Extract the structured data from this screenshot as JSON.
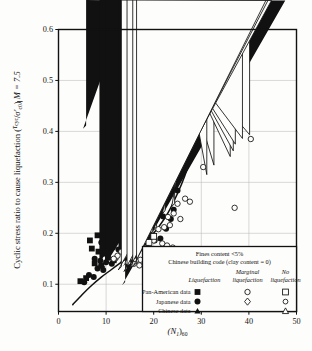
{
  "figure": {
    "background": "#fdfdfb",
    "frame_color": "#111111",
    "grid_color": "#b9b9b9",
    "curve_color": "#111111"
  },
  "axes": {
    "x_title_main": "(N",
    "x_title_sub1": "1",
    "x_title_mid": ")",
    "x_title_sub2": "60",
    "x_ticks": [
      "0",
      "10",
      "20",
      "30",
      "40",
      "50"
    ],
    "x_values": [
      0,
      10,
      20,
      30,
      40,
      50
    ],
    "y_ticks": [
      "0.1",
      "0.2",
      "0.3",
      "0.4",
      "0.5",
      "0.6"
    ],
    "y_values": [
      0.1,
      0.2,
      0.3,
      0.4,
      0.5,
      0.6
    ],
    "y_title_part1": "Cyclic stress ratio to cause liquefaction",
    "y_title_num": "τ",
    "y_title_num_sub": "cyc",
    "y_title_den": "σ'",
    "y_title_den_sub": "c0",
    "y_title_magnitude": "M = 7.5",
    "xlim": [
      0,
      50
    ],
    "ylim": [
      0.05,
      0.6
    ]
  },
  "legend": {
    "note_line1": "Fines content <5%",
    "note_line2": "Chinese building code (clay content = 0)",
    "col_header_2_line1": "Marginal",
    "col_header_3_line1": "No",
    "col_header_1": "Liquefaction",
    "col_header_2": "liquefaction",
    "col_header_3": "liquefaction",
    "rows": [
      {
        "label": "Pan-American data",
        "liq": "filled-square",
        "marginal": "open-circle",
        "no": "open-square"
      },
      {
        "label": "Japanese data",
        "liq": "filled-circle",
        "marginal": "open-diamond",
        "no": "open-circle-small"
      },
      {
        "label": "Chinese data",
        "liq": "filled-triangle",
        "marginal": "",
        "no": "open-triangle"
      }
    ]
  },
  "chart_data": {
    "type": "scatter",
    "title": "",
    "xlabel": "(N1)60",
    "ylabel": "Cyclic stress ratio to cause liquefaction (τcyc/σ'c0) M = 7.5",
    "xlim": [
      0,
      50
    ],
    "ylim": [
      0.05,
      0.6
    ],
    "grid": true,
    "series": [
      {
        "name": "Japanese data - Liquefaction",
        "marker": "filled-circle",
        "points": [
          [
            11.0,
            0.345
          ],
          [
            14.6,
            0.377
          ],
          [
            14.5,
            0.325
          ],
          [
            12.6,
            0.295
          ],
          [
            12.2,
            0.268
          ],
          [
            17.6,
            0.268
          ],
          [
            20.6,
            0.262
          ],
          [
            22.0,
            0.233
          ],
          [
            9.4,
            0.232
          ],
          [
            11.0,
            0.225
          ],
          [
            13.0,
            0.228
          ],
          [
            14.2,
            0.222
          ],
          [
            15.6,
            0.252
          ],
          [
            12.4,
            0.206
          ],
          [
            13.1,
            0.203
          ],
          [
            13.8,
            0.2
          ],
          [
            14.6,
            0.199
          ],
          [
            15.6,
            0.198
          ],
          [
            16.6,
            0.196
          ],
          [
            17.6,
            0.206
          ],
          [
            18.4,
            0.196
          ],
          [
            19.6,
            0.193
          ],
          [
            10.6,
            0.198
          ],
          [
            11.6,
            0.194
          ],
          [
            9.0,
            0.182
          ],
          [
            10.0,
            0.178
          ],
          [
            11.4,
            0.172
          ],
          [
            12.6,
            0.168
          ],
          [
            7.6,
            0.15
          ],
          [
            8.8,
            0.146
          ],
          [
            10.0,
            0.143
          ],
          [
            11.2,
            0.14
          ],
          [
            8.2,
            0.131
          ],
          [
            9.4,
            0.128
          ],
          [
            6.4,
            0.118
          ],
          [
            7.4,
            0.114
          ],
          [
            5.4,
            0.104
          ],
          [
            18.6,
            0.181
          ],
          [
            20.2,
            0.186
          ],
          [
            21.4,
            0.19
          ],
          [
            22.6,
            0.209
          ],
          [
            23.6,
            0.228
          ],
          [
            24.2,
            0.246
          ],
          [
            16.2,
            0.177
          ],
          [
            12.0,
            0.247
          ],
          [
            13.4,
            0.245
          ],
          [
            25.0,
            0.284
          ]
        ]
      },
      {
        "name": "Pan-American data - Liquefaction",
        "marker": "filled-square",
        "points": [
          [
            6.6,
            0.186
          ],
          [
            8.2,
            0.196
          ],
          [
            7.0,
            0.17
          ],
          [
            8.4,
            0.164
          ],
          [
            9.6,
            0.16
          ],
          [
            7.6,
            0.141
          ],
          [
            9.0,
            0.136
          ],
          [
            4.6,
            0.106
          ],
          [
            5.8,
            0.112
          ],
          [
            10.4,
            0.152
          ],
          [
            11.6,
            0.147
          ]
        ]
      },
      {
        "name": "Chinese data - Liquefaction",
        "marker": "filled-triangle",
        "points": [
          [
            5.8,
            0.405
          ],
          [
            9.8,
            0.197
          ],
          [
            10.4,
            0.194
          ],
          [
            11.0,
            0.192
          ],
          [
            8.6,
            0.132
          ],
          [
            9.8,
            0.128
          ],
          [
            12.6,
            0.142
          ],
          [
            13.4,
            0.139
          ],
          [
            14.2,
            0.135
          ],
          [
            14.0,
            0.098
          ]
        ]
      },
      {
        "name": "Japanese data - Marginal liquefaction",
        "marker": "open-diamond",
        "points": [
          [
            22.4,
            0.238
          ],
          [
            20.6,
            0.206
          ],
          [
            19.4,
            0.2
          ],
          [
            18.0,
            0.196
          ],
          [
            16.0,
            0.168
          ],
          [
            16.8,
            0.182
          ],
          [
            24.4,
            0.252
          ]
        ]
      },
      {
        "name": "Japanese data - No liquefaction",
        "marker": "open-circle",
        "points": [
          [
            30.0,
            0.47
          ],
          [
            40.4,
            0.385
          ],
          [
            30.4,
            0.33
          ],
          [
            37.0,
            0.25
          ],
          [
            28.4,
            0.42
          ],
          [
            26.6,
            0.268
          ],
          [
            27.6,
            0.262
          ],
          [
            25.0,
            0.258
          ],
          [
            24.2,
            0.239
          ],
          [
            23.4,
            0.216
          ],
          [
            22.2,
            0.212
          ],
          [
            21.0,
            0.208
          ],
          [
            20.0,
            0.186
          ],
          [
            21.8,
            0.18
          ],
          [
            22.8,
            0.176
          ],
          [
            24.0,
            0.172
          ],
          [
            19.2,
            0.164
          ],
          [
            20.2,
            0.158
          ],
          [
            21.4,
            0.154
          ],
          [
            18.2,
            0.15
          ],
          [
            17.2,
            0.148
          ],
          [
            16.2,
            0.146
          ],
          [
            15.0,
            0.152
          ],
          [
            14.0,
            0.158
          ],
          [
            13.2,
            0.164
          ],
          [
            14.6,
            0.143
          ],
          [
            15.8,
            0.14
          ],
          [
            17.0,
            0.137
          ],
          [
            18.4,
            0.134
          ],
          [
            19.6,
            0.131
          ],
          [
            12.4,
            0.156
          ],
          [
            11.6,
            0.15
          ],
          [
            23.0,
            0.232
          ],
          [
            25.6,
            0.228
          ]
        ]
      },
      {
        "name": "Pan-American data - No liquefaction",
        "marker": "open-square",
        "points": [
          [
            18.2,
            0.212
          ],
          [
            19.2,
            0.208
          ],
          [
            17.0,
            0.19
          ],
          [
            18.0,
            0.186
          ],
          [
            19.0,
            0.182
          ],
          [
            16.2,
            0.178
          ],
          [
            17.2,
            0.174
          ],
          [
            15.4,
            0.17
          ],
          [
            20.0,
            0.194
          ]
        ]
      },
      {
        "name": "Chinese data - No liquefaction",
        "marker": "open-triangle",
        "points": [
          [
            13.2,
            0.128
          ],
          [
            14.4,
            0.125
          ],
          [
            15.6,
            0.132
          ],
          [
            16.4,
            0.136
          ]
        ]
      }
    ],
    "curves": [
      {
        "name": "CRR boundary curve (solid)",
        "style": "solid",
        "points": [
          [
            3.0,
            0.06
          ],
          [
            5.0,
            0.08
          ],
          [
            7.0,
            0.098
          ],
          [
            9.0,
            0.114
          ],
          [
            11.0,
            0.128
          ],
          [
            13.0,
            0.142
          ],
          [
            15.0,
            0.156
          ],
          [
            17.0,
            0.172
          ],
          [
            19.0,
            0.19
          ],
          [
            21.0,
            0.212
          ],
          [
            23.0,
            0.24
          ],
          [
            25.0,
            0.278
          ],
          [
            26.5,
            0.312
          ],
          [
            28.0,
            0.355
          ]
        ]
      },
      {
        "name": "CRR boundary curve (dashed extrapolation)",
        "style": "dashed",
        "points": [
          [
            28.0,
            0.355
          ],
          [
            29.0,
            0.392
          ],
          [
            29.8,
            0.432
          ],
          [
            30.2,
            0.47
          ],
          [
            30.4,
            0.505
          ]
        ]
      }
    ]
  }
}
